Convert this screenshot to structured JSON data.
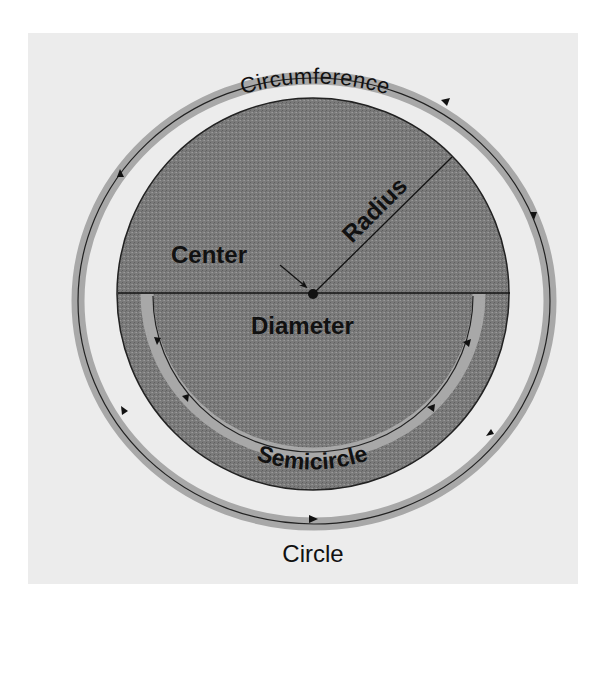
{
  "diagram": {
    "title": "Circle",
    "labels": {
      "circumference": "Circumference",
      "radius": "Radius",
      "center": "Center",
      "diameter": "Diameter",
      "semicircle": "Semicircle",
      "circle": "Circle"
    },
    "colors": {
      "page_background": "#ffffff",
      "panel_background": "#eeeeee",
      "disk_fill": "#7c7c7c",
      "band_fill": "#a9a9a9",
      "line": "#111111",
      "text": "#111111"
    }
  }
}
